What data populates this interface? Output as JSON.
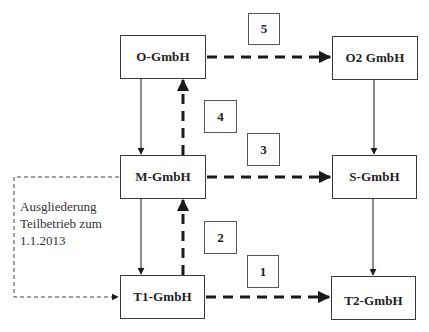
{
  "diagram": {
    "type": "corporate restructuring flow diagram",
    "nodes": [
      {
        "id": "o",
        "label": "O-GmbH",
        "x": 120,
        "y": 35,
        "w": 86,
        "h": 44
      },
      {
        "id": "m",
        "label": "M-GmbH",
        "x": 120,
        "y": 155,
        "w": 86,
        "h": 44
      },
      {
        "id": "t1",
        "label": "T1-GmbH",
        "x": 120,
        "y": 275,
        "w": 85,
        "h": 44
      },
      {
        "id": "o2",
        "label": "O2 GmbH",
        "x": 332,
        "y": 36,
        "w": 86,
        "h": 44
      },
      {
        "id": "s",
        "label": "S-GmbH",
        "x": 332,
        "y": 155,
        "w": 85,
        "h": 44
      },
      {
        "id": "t2",
        "label": "T2-GmbH",
        "x": 331,
        "y": 276,
        "w": 85,
        "h": 44
      }
    ],
    "step_labels": [
      {
        "id": "step5",
        "label": "5",
        "x": 248,
        "y": 13,
        "w": 32,
        "h": 32
      },
      {
        "id": "step4",
        "label": "4",
        "x": 204,
        "y": 100,
        "w": 33,
        "h": 33
      },
      {
        "id": "step3",
        "label": "3",
        "x": 247,
        "y": 133,
        "w": 33,
        "h": 33
      },
      {
        "id": "step2",
        "label": "2",
        "x": 204,
        "y": 221,
        "w": 33,
        "h": 33
      },
      {
        "id": "step1",
        "label": "1",
        "x": 247,
        "y": 255,
        "w": 32,
        "h": 33
      }
    ],
    "edges": [
      {
        "from": "o",
        "to": "m",
        "style": "solid-thin",
        "direction": "down"
      },
      {
        "from": "m",
        "to": "t1",
        "style": "solid-thin",
        "direction": "down"
      },
      {
        "from": "o2",
        "to": "s",
        "style": "solid-thin",
        "direction": "down"
      },
      {
        "from": "s",
        "to": "t2",
        "style": "solid-thin",
        "direction": "down"
      },
      {
        "from": "t1",
        "to": "m",
        "style": "dashed-thick",
        "step": "2",
        "direction": "up"
      },
      {
        "from": "m",
        "to": "o",
        "style": "dashed-thick",
        "step": "4",
        "direction": "up"
      },
      {
        "from": "t1",
        "to": "t2",
        "style": "dashed-thick",
        "step": "1",
        "direction": "right"
      },
      {
        "from": "m",
        "to": "s",
        "style": "dashed-thick",
        "step": "3",
        "direction": "right"
      },
      {
        "from": "o",
        "to": "o2",
        "style": "dashed-thick",
        "step": "5",
        "direction": "right"
      },
      {
        "from": "m",
        "to": "t1",
        "style": "dotted-thin",
        "direction": "around-left",
        "annotation": "spinoff"
      }
    ],
    "annotation": {
      "lines": [
        "Ausgliederung",
        "Teilbetrieb zum",
        "1.1.2013"
      ]
    },
    "colors": {
      "stroke": "#1a1a1a",
      "box_border": "#3a3a3a",
      "background": "#ffffff"
    }
  }
}
